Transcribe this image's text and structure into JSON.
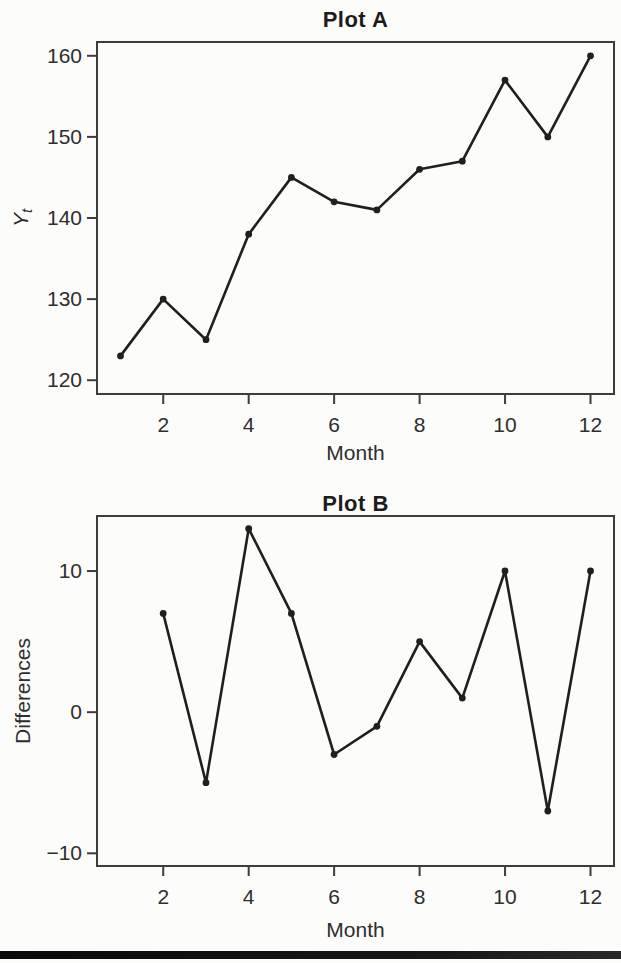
{
  "page": {
    "background_color": "#fcfcfa",
    "footer_bar_color": "#0a0a0a"
  },
  "chart_data": [
    {
      "type": "line",
      "title": "Plot A",
      "xlabel": "Month",
      "ylabel": "Y_t",
      "ylabel_base": "Y",
      "ylabel_sub": "t",
      "x": [
        1,
        2,
        3,
        4,
        5,
        6,
        7,
        8,
        9,
        10,
        11,
        12
      ],
      "y": [
        123,
        130,
        125,
        138,
        145,
        142,
        141,
        146,
        147,
        157,
        150,
        160
      ],
      "xlim": [
        0.45,
        12.55
      ],
      "ylim": [
        118.3,
        161.7
      ],
      "xticks": [
        2,
        4,
        6,
        8,
        10,
        12
      ],
      "yticks": [
        120,
        130,
        140,
        150,
        160
      ],
      "grid": false,
      "legend": null,
      "line_color": "#1f1f1f",
      "marker": "filled-circle",
      "frame_color": "#3d3d3d"
    },
    {
      "type": "line",
      "title": "Plot B",
      "xlabel": "Month",
      "ylabel": "Differences",
      "x": [
        2,
        3,
        4,
        5,
        6,
        7,
        8,
        9,
        10,
        11,
        12
      ],
      "y": [
        7,
        -5,
        13,
        7,
        -3,
        -1,
        5,
        1,
        10,
        -7,
        10
      ],
      "xlim": [
        0.45,
        12.55
      ],
      "ylim": [
        -10.9,
        13.9
      ],
      "xticks": [
        2,
        4,
        6,
        8,
        10,
        12
      ],
      "yticks": [
        -10,
        0,
        10
      ],
      "grid": false,
      "legend": null,
      "line_color": "#1f1f1f",
      "marker": "filled-circle",
      "frame_color": "#3d3d3d"
    }
  ]
}
